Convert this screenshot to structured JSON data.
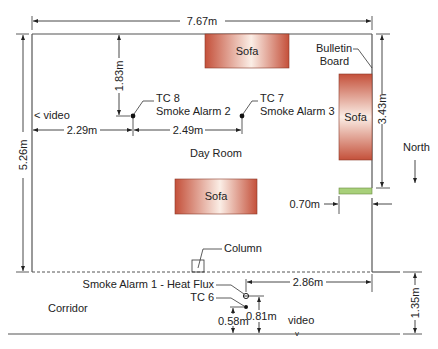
{
  "diagram": {
    "rooms": {
      "day_room": "Day Room",
      "corridor": "Corridor"
    },
    "furniture": {
      "sofa_top": "Sofa",
      "sofa_right": "Sofa",
      "sofa_center": "Sofa",
      "bulletin_board_line1": "Bulletin",
      "bulletin_board_line2": "Board",
      "column": "Column"
    },
    "sensors": {
      "tc8_line1": "TC 8",
      "tc8_line2": "Smoke Alarm 2",
      "tc7_line1": "TC 7",
      "tc7_line2": "Smoke Alarm 3",
      "alarm1": "Smoke Alarm 1 - Heat Flux",
      "tc6": "TC 6"
    },
    "cameras": {
      "video_left": "< video",
      "video_bottom": "video",
      "video_bottom_mark": "v"
    },
    "orientation": {
      "north": "North"
    },
    "dimensions": {
      "room_width": "7.67m",
      "room_depth": "5.26m",
      "tc8_from_top": "1.83m",
      "tc8_from_left": "2.29m",
      "tc8_to_tc7": "2.49m",
      "right_wall_segment": "3.43m",
      "door_width": "0.70m",
      "alarm1_to_right": "2.86m",
      "corridor_width": "1.35m",
      "tc6_height": "0.58m",
      "alarm1_height": "0.81m"
    },
    "colors": {
      "sofa_dark": "#c4503a",
      "sofa_light": "#fbeee6",
      "door": "#a8d07a",
      "wall": "#555555"
    }
  }
}
